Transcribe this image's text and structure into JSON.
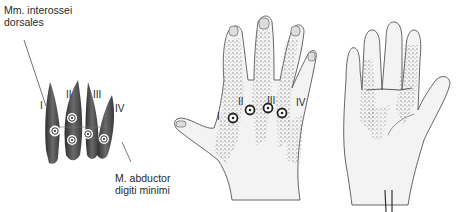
{
  "diagram": {
    "type": "anatomical-illustration",
    "panels": [
      {
        "id": "muscle-detail",
        "labels": {
          "interossei_line1": "Mm. interossei",
          "interossei_line2": "dorsales",
          "abductor_line1": "M. abductor",
          "abductor_line2": "digiti minimi"
        },
        "muscle_numbers": [
          "I",
          "II",
          "III",
          "IV"
        ],
        "trigger_points": 5
      },
      {
        "id": "hand-dorsal",
        "muscle_numbers": [
          "I",
          "II",
          "III",
          "IV"
        ],
        "trigger_points": 4
      },
      {
        "id": "hand-palmar",
        "muscle_numbers": [],
        "trigger_points": 0
      }
    ],
    "colors": {
      "outline": "#5a5a5a",
      "muscle": "#4a4a4a",
      "referral_shading": "#8a8a8a",
      "skin": "#f1f1f1"
    }
  }
}
